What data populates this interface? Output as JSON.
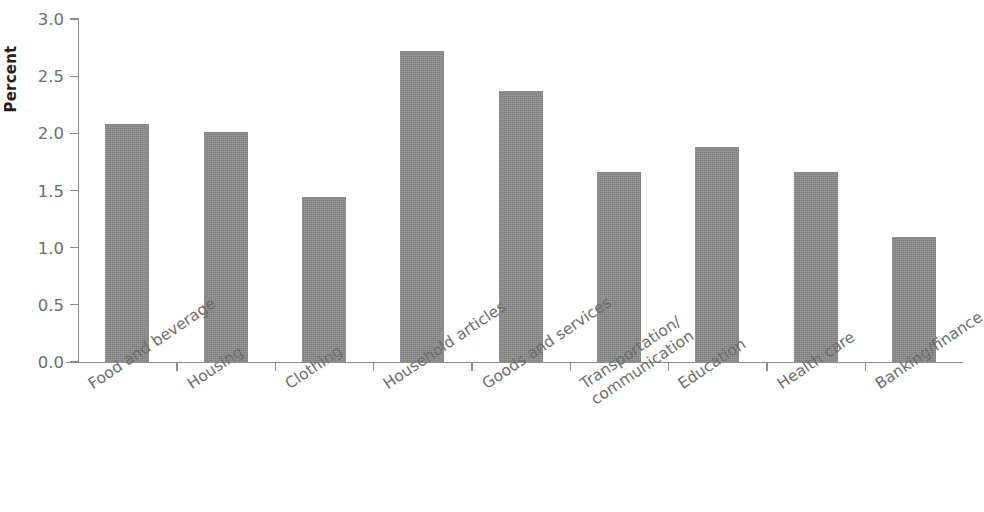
{
  "chart_data": {
    "type": "bar",
    "title": "",
    "subtitle": "",
    "xlabel": "",
    "ylabel": "Percent",
    "ylim": [
      0,
      3.0
    ],
    "ytick_values": [
      0.0,
      0.5,
      1.0,
      1.5,
      2.0,
      2.5,
      3.0
    ],
    "ytick_labels": [
      "0.0",
      "0.5",
      "1.0",
      "1.5",
      "2.0",
      "2.5",
      "3.0"
    ],
    "grid": false,
    "legend": null,
    "legend_position": "none",
    "bar_color": "#8b8b8b",
    "axis_color": "#8c8c8c",
    "label_color": "#6e6e6e",
    "categories": [
      "Food and beverage",
      "Housing",
      "Clothing",
      "Household articles",
      "Goods and services",
      "Transportation/ communication",
      "Education",
      "Health care",
      "Banking/finance"
    ],
    "category_lines": [
      [
        "Food and beverage"
      ],
      [
        "Housing"
      ],
      [
        "Clothing"
      ],
      [
        "Household articles"
      ],
      [
        "Goods and services"
      ],
      [
        "Transportation/",
        "communication"
      ],
      [
        "Education"
      ],
      [
        "Health care"
      ],
      [
        "Banking/finance"
      ]
    ],
    "values": [
      2.08,
      2.01,
      1.44,
      2.72,
      2.37,
      1.66,
      1.88,
      1.66,
      1.09
    ]
  }
}
